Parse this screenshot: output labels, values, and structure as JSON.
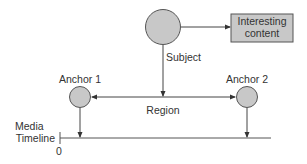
{
  "diagram": {
    "nodes": {
      "subject": {
        "label": "Subject"
      },
      "content": {
        "label_line1": "Interesting",
        "label_line2": "content"
      },
      "anchor1": {
        "label": "Anchor 1"
      },
      "anchor2": {
        "label": "Anchor 2"
      }
    },
    "region": {
      "label": "Region"
    },
    "timeline": {
      "label_line1": "Media",
      "label_line2": "Timeline",
      "origin": "0"
    },
    "colors": {
      "fill": "#c8c8c8",
      "stroke": "#555555",
      "line": "#444444"
    }
  }
}
